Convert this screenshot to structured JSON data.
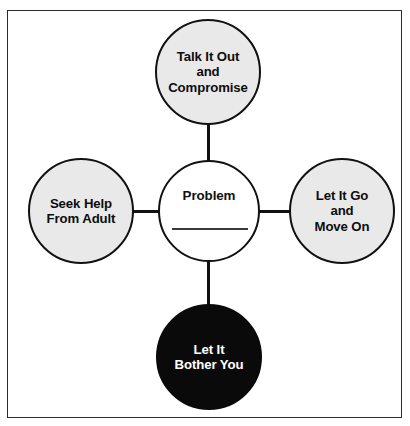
{
  "diagram": {
    "center": {
      "id": "center-node",
      "label": "Problem",
      "has_blank_line": true,
      "fill": "#ffffff",
      "text_color": "#111111"
    },
    "nodes": [
      {
        "id": "node-top",
        "position": "top",
        "label": "Talk It Out\nand\nCompromise",
        "lines": [
          "Talk It Out",
          "and",
          "Compromise"
        ],
        "fill": "#e9e9e9",
        "text_color": "#0d0d0d",
        "tone": "positive"
      },
      {
        "id": "node-left",
        "position": "left",
        "label": "Seek Help\nFrom Adult",
        "lines": [
          "Seek Help",
          "From Adult"
        ],
        "fill": "#e9e9e9",
        "text_color": "#0d0d0d",
        "tone": "positive"
      },
      {
        "id": "node-right",
        "position": "right",
        "label": "Let It Go\nand\nMove On",
        "lines": [
          "Let It Go",
          "and",
          "Move On"
        ],
        "fill": "#e9e9e9",
        "text_color": "#0d0d0d",
        "tone": "positive"
      },
      {
        "id": "node-bottom",
        "position": "bottom",
        "label": "Let It\nBother You",
        "lines": [
          "Let It",
          "Bother You"
        ],
        "fill": "#0a0a0a",
        "text_color": "#ffffff",
        "tone": "negative"
      }
    ],
    "connectors": [
      {
        "id": "connector-top",
        "from": "center-node",
        "to": "node-top",
        "orientation": "vertical"
      },
      {
        "id": "connector-bottom",
        "from": "center-node",
        "to": "node-bottom",
        "orientation": "vertical"
      },
      {
        "id": "connector-left",
        "from": "center-node",
        "to": "node-left",
        "orientation": "horizontal"
      },
      {
        "id": "connector-right",
        "from": "center-node",
        "to": "node-right",
        "orientation": "horizontal"
      }
    ],
    "colors": {
      "stroke": "#111111",
      "node_gray": "#e9e9e9",
      "node_black": "#0a0a0a",
      "background": "#ffffff",
      "frame_border": "#2b2b2b",
      "blank_line": "#3a3a3a"
    }
  }
}
